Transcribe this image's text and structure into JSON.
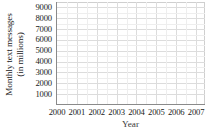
{
  "chart_data": {
    "type": "line",
    "title": "",
    "xlabel": "Year",
    "ylabel_line1": "Monthly text messages",
    "ylabel_line2": "(in millions)",
    "ylabel": "Monthly text messages (in millions)",
    "x_tick_labels": [
      "2000",
      "2001",
      "2002",
      "2003",
      "2004",
      "2005",
      "2006",
      "2007"
    ],
    "x_values": [
      2000,
      2001,
      2002,
      2003,
      2004,
      2005,
      2006,
      2007
    ],
    "xlim": [
      2000,
      2007.5
    ],
    "y_tick_labels": [
      "9000",
      "8000",
      "7000",
      "6000",
      "5000",
      "4000",
      "3000",
      "2000",
      "1000"
    ],
    "y_values": [
      9000,
      8000,
      7000,
      6000,
      5000,
      4000,
      3000,
      2000,
      1000
    ],
    "ylim": [
      0,
      9500
    ],
    "grid": true,
    "grid_color": "#dcdcdc",
    "axis_color": "#8a8a8a",
    "legend": "none",
    "series": [],
    "data_points": [],
    "note": "Empty grid — blank coordinate axes with no plotted data"
  },
  "axes": {
    "y_title_line1": "Monthly text messages",
    "y_title_line2": "(in millions)",
    "x_title": "Year"
  }
}
